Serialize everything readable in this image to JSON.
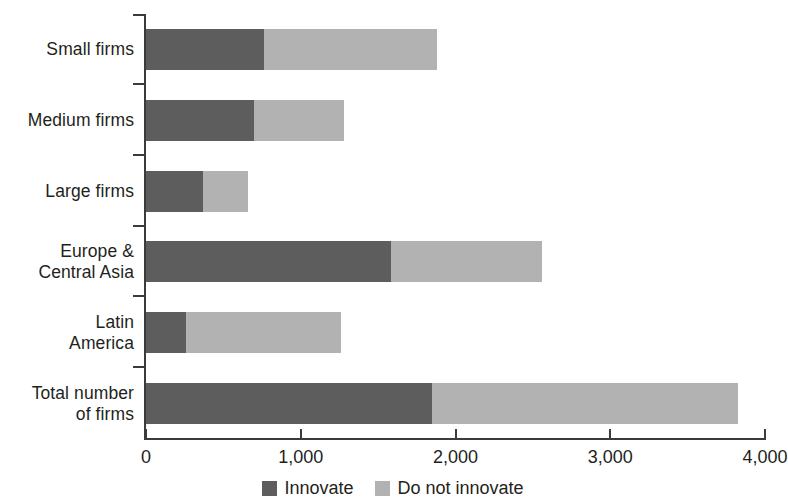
{
  "chart_data": {
    "type": "bar",
    "orientation": "horizontal",
    "stacked": true,
    "title": "",
    "subtitle": "",
    "xlabel": "",
    "ylabel": "",
    "xlim": [
      0,
      4000
    ],
    "xticks": [
      0,
      1000,
      2000,
      3000,
      4000
    ],
    "xtick_labels": [
      "0",
      "1,000",
      "2,000",
      "3,000",
      "4,000"
    ],
    "grid": false,
    "legend_position": "bottom-center",
    "categories": [
      "Small firms",
      "Medium firms",
      "Large firms",
      "Europe & Central Asia",
      "Latin America",
      "Total number of firms"
    ],
    "category_label_lines": [
      [
        "Small firms"
      ],
      [
        "Medium firms"
      ],
      [
        "Large firms"
      ],
      [
        "Europe &",
        "Central Asia"
      ],
      [
        "Latin",
        "America"
      ],
      [
        "Total number",
        "of firms"
      ]
    ],
    "series": [
      {
        "name": "Innovate",
        "color": "#5d5d5d",
        "values": [
          760,
          700,
          370,
          1580,
          260,
          1850
        ]
      },
      {
        "name": "Do not innovate",
        "color": "#b2b2b2",
        "values": [
          1120,
          580,
          290,
          980,
          1000,
          1975
        ]
      }
    ],
    "totals": [
      1880,
      1280,
      660,
      2560,
      1260,
      3825
    ],
    "legend": [
      {
        "label": "Innovate",
        "color": "#5d5d5d"
      },
      {
        "label": "Do not innovate",
        "color": "#b2b2b2"
      }
    ]
  },
  "colors": {
    "innovate": "#5d5d5d",
    "do_not_innovate": "#b2b2b2",
    "axis": "#3b3b3b",
    "text": "#231f20",
    "background": "#ffffff"
  }
}
